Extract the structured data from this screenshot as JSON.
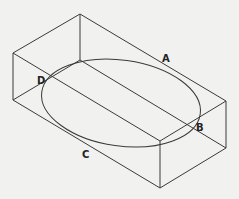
{
  "diagram": {
    "title": "",
    "labels": [
      {
        "text": "A",
        "x": 164,
        "y": 63
      },
      {
        "text": "B",
        "x": 198,
        "y": 130
      },
      {
        "text": "C",
        "x": 82,
        "y": 157
      },
      {
        "text": "D",
        "x": 37,
        "y": 82
      }
    ],
    "colors": {
      "line": "#3a3a3a",
      "background": "#f1f1ef"
    }
  }
}
